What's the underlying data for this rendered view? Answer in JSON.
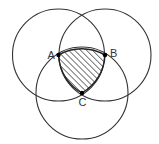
{
  "diagram": {
    "type": "three intersecting circles (Reuleaux triangle)",
    "stroke_color": "#333333",
    "hatch_color": "#333333",
    "points": [
      {
        "id": "A",
        "label": "A",
        "x": 58.5,
        "y": 55
      },
      {
        "id": "B",
        "label": "B",
        "x": 105,
        "y": 55
      },
      {
        "id": "C",
        "label": "C",
        "x": 82,
        "y": 93
      }
    ],
    "circles": [
      {
        "name": "circle-centered-A",
        "cx": 58.5,
        "cy": 55,
        "r": 46
      },
      {
        "name": "circle-centered-B",
        "cx": 105,
        "cy": 55,
        "r": 46
      },
      {
        "name": "circle-centered-C",
        "cx": 82,
        "cy": 93,
        "r": 46
      }
    ],
    "shaded_region": "hatched curved triangle ABC (intersection of all three circles)",
    "labels": {
      "a": "A",
      "b": "B",
      "c": "C"
    }
  }
}
